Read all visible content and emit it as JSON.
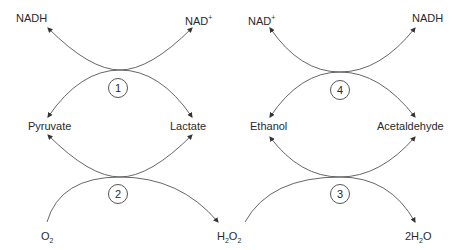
{
  "reactions": [
    {
      "id": "1",
      "top_left": "NADH",
      "top_right": "NAD",
      "top_right_sup": "+",
      "bottom_left": "Pyruvate",
      "bottom_right": "Lactate"
    },
    {
      "id": "2",
      "top_left": "Pyruvate",
      "top_right": "Lactate",
      "bottom_left": "O",
      "bottom_left_sub": "2",
      "bottom_right": "H",
      "bottom_right_sub": "2",
      "bottom_right_tail": "O",
      "bottom_right_sub2": "2"
    },
    {
      "id": "4",
      "top_left": "NAD",
      "top_left_sup": "+",
      "top_right": "NADH",
      "bottom_left": "Ethanol",
      "bottom_right": "Acetaldehyde"
    },
    {
      "id": "3",
      "top_left": "Ethanol",
      "top_right": "Acetaldehyde",
      "bottom_left": "H2O2",
      "bottom_right_prefix": "2H",
      "bottom_right_sub": "2",
      "bottom_right_tail": "O"
    }
  ],
  "labels": {
    "nadh_left": "NADH",
    "nad_left": "NAD",
    "nad_sup": "+",
    "nad_right": "NAD",
    "nadh_right": "NADH",
    "pyruvate": "Pyruvate",
    "lactate": "Lactate",
    "ethanol": "Ethanol",
    "acetaldehyde": "Acetaldehyde",
    "o2_main": "O",
    "o2_sub": "2",
    "h2o2_h": "H",
    "h2o2_sub1": "2",
    "h2o2_o": "O",
    "h2o2_sub2": "2",
    "h2o_prefix": "2H",
    "h2o_sub": "2",
    "h2o_o": "O",
    "circle_1": "1",
    "circle_2": "2",
    "circle_3": "3",
    "circle_4": "4"
  },
  "colors": {
    "line": "#555555",
    "text": "#2a2a2a"
  }
}
